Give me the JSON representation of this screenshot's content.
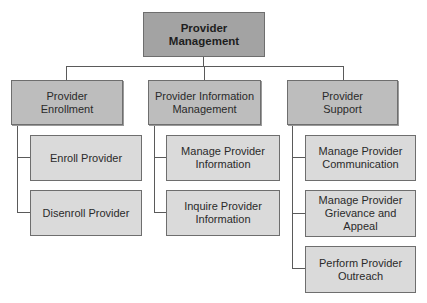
{
  "root": {
    "label": "Provider Management"
  },
  "branches": [
    {
      "label": "Provider Enrollment",
      "children": [
        {
          "label": "Enroll Provider"
        },
        {
          "label": "Disenroll Provider"
        }
      ]
    },
    {
      "label": "Provider Information Management",
      "children": [
        {
          "label": "Manage Provider Information"
        },
        {
          "label": "Inquire Provider Information"
        }
      ]
    },
    {
      "label": "Provider Support",
      "children": [
        {
          "label": "Manage Provider Communication"
        },
        {
          "label": "Manage Provider Grievance and Appeal"
        },
        {
          "label": "Perform Provider Outreach"
        }
      ]
    }
  ],
  "colors": {
    "root_fill": "#a3a3a3",
    "branch_fill": "#bdbdbd",
    "leaf_fill": "#dadada",
    "line": "#5a5a5a"
  }
}
